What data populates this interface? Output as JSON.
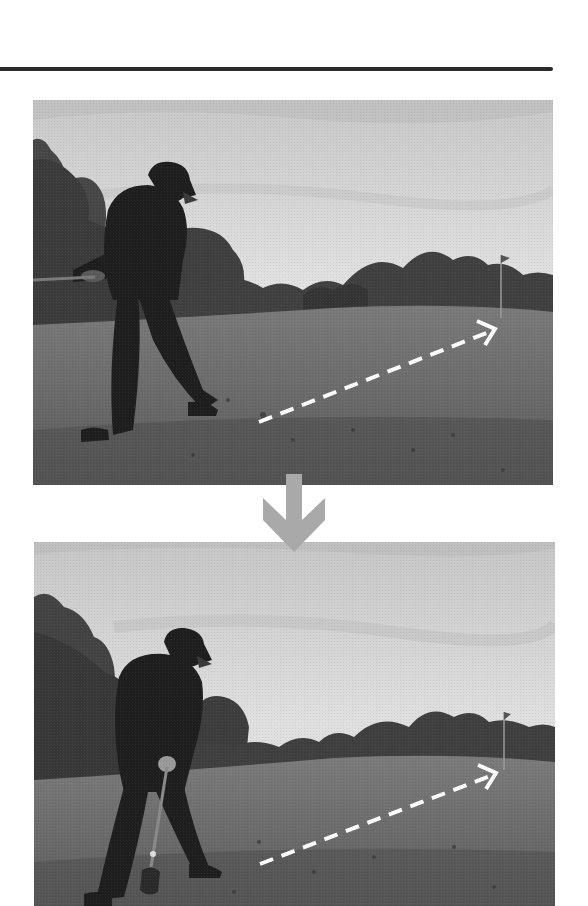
{
  "page": {
    "type": "scanned-book-page",
    "colors": {
      "rule": "#2b2b2b",
      "transition_arrow": "#a9a9a9",
      "trajectory_arrow": "#ffffff",
      "sky": "#d9d9d9",
      "trees": "#3e3e3e",
      "grass": "#6f6f6f",
      "golfer": "#1e1e1e"
    }
  },
  "figures": [
    {
      "id": "photo-1",
      "description": "Golfer at finish of chip shot, club held across body, dashed trajectory arrow toward flagstick",
      "elements": [
        "golfer",
        "trees",
        "fairway",
        "flagstick",
        "dashed-trajectory-arrow"
      ]
    },
    {
      "id": "photo-2",
      "description": "Golfer at address position with club grounded behind ball, dashed trajectory arrow toward flagstick",
      "elements": [
        "golfer",
        "club",
        "trees",
        "fairway",
        "flagstick",
        "dashed-trajectory-arrow"
      ]
    }
  ],
  "transition_icon": "down-arrow-icon"
}
